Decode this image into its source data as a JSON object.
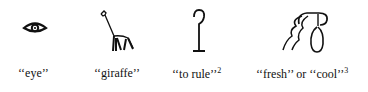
{
  "figure": {
    "items": [
      {
        "glyph": "eye-hieroglyph",
        "caption": "‘‘eye’’",
        "footnote": ""
      },
      {
        "glyph": "giraffe-hieroglyph",
        "caption": "‘‘giraffe’’",
        "footnote": ""
      },
      {
        "glyph": "crook-hieroglyph",
        "caption": "‘‘to rule’’",
        "footnote": "2"
      },
      {
        "glyph": "water-jar-hieroglyph",
        "caption": "‘‘fresh’’ or ‘‘cool’’",
        "footnote": "3"
      }
    ]
  }
}
